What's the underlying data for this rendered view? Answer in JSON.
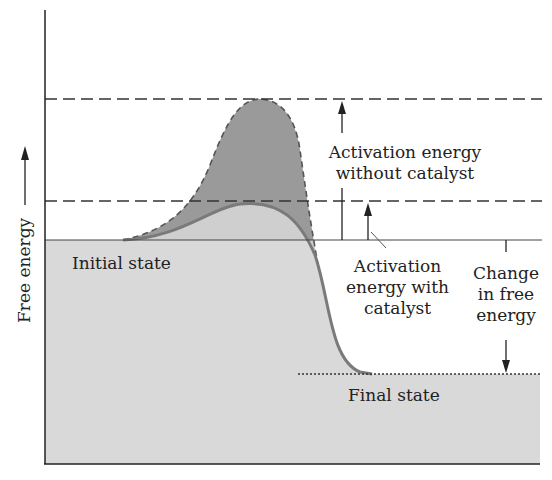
{
  "diagram": {
    "y_axis_label": "Free energy",
    "labels": {
      "initial_state": "Initial state",
      "final_state": "Final state",
      "activation_without_line1": "Activation energy",
      "activation_without_line2": "without catalyst",
      "activation_with_line1": "Activation",
      "activation_with_line2": "energy with",
      "activation_with_line3": "catalyst",
      "change_line1": "Change",
      "change_line2": "in free",
      "change_line3": "energy"
    },
    "colors": {
      "lower_fill": "#d9d9d9",
      "uncatalyzed_fill": "#9a9a9a",
      "catalyzed_fill": "#cfcfcf",
      "catalyzed_curve": "#7a7a7a",
      "line": "#333333"
    }
  }
}
